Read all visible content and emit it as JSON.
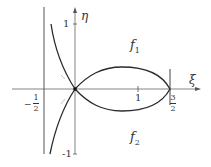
{
  "diagram": {
    "axes": {
      "x_label": "ξ",
      "y_label": "η",
      "x_ticks": [
        {
          "value": 1,
          "label": "1"
        },
        {
          "value": 1.5,
          "label_num": "3",
          "label_den": "2"
        }
      ],
      "x_neg_tick": {
        "value": -0.5,
        "label_sign": "−",
        "label_num": "1",
        "label_den": "2"
      },
      "y_ticks": [
        {
          "value": 1,
          "label": "1"
        },
        {
          "value": -1,
          "label": "-1"
        }
      ]
    },
    "regions": {
      "upper": {
        "label": "f",
        "subscript": "1"
      },
      "lower": {
        "label": "f",
        "subscript": "2"
      }
    },
    "curves": [
      "vertical asymptote at ξ = −1/2",
      "closed loop from origin to ξ = 3/2",
      "branches approaching asymptote ξ = −1/2 through origin"
    ],
    "colors": {
      "axis": "#555555",
      "curve": "#2a2a2a",
      "text": "#333333"
    }
  }
}
